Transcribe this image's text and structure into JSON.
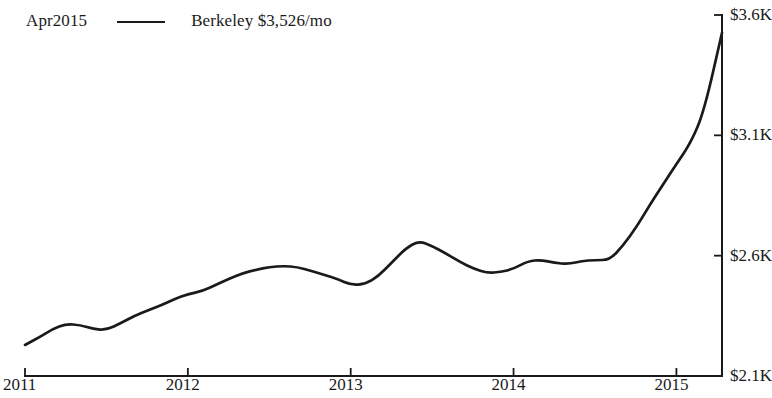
{
  "legend": {
    "date_label": "Apr2015",
    "series_label": "Berkeley $3,526/mo",
    "swatch": "line-swatch"
  },
  "chart_data": {
    "type": "line",
    "title": "",
    "subtitle": "",
    "xlabel": "",
    "ylabel": "",
    "xlim": [
      2011.0,
      2015.28
    ],
    "ylim": [
      2100,
      3600
    ],
    "grid": false,
    "legend_position": "top-left",
    "y_axis_side": "right",
    "xtick_labels": [
      "2011",
      "2012",
      "2013",
      "2014",
      "2015"
    ],
    "xtick_values": [
      2011,
      2012,
      2013,
      2014,
      2015
    ],
    "ytick_labels": [
      "$3.6K",
      "$3.1K",
      "$2.6K",
      "$2.1K"
    ],
    "ytick_values": [
      3600,
      3100,
      2600,
      2100
    ],
    "series": [
      {
        "name": "Berkeley",
        "color": "#1a1a1a",
        "final_value": 3526,
        "final_label": "Apr2015",
        "x": [
          2011.0,
          2011.09,
          2011.17,
          2011.25,
          2011.34,
          2011.42,
          2011.5,
          2011.59,
          2011.67,
          2011.76,
          2011.84,
          2011.92,
          2012.0,
          2012.09,
          2012.17,
          2012.25,
          2012.34,
          2012.42,
          2012.5,
          2012.59,
          2012.67,
          2012.76,
          2012.84,
          2012.92,
          2013.0,
          2013.09,
          2013.17,
          2013.25,
          2013.34,
          2013.42,
          2013.5,
          2013.59,
          2013.67,
          2013.76,
          2013.84,
          2013.92,
          2014.0,
          2014.09,
          2014.17,
          2014.25,
          2014.34,
          2014.42,
          2014.5,
          2014.59,
          2014.67,
          2014.76,
          2014.84,
          2014.92,
          2015.0,
          2015.09,
          2015.17,
          2015.28
        ],
        "y": [
          2229,
          2262,
          2295,
          2316,
          2312,
          2295,
          2291,
          2320,
          2349,
          2374,
          2395,
          2420,
          2440,
          2453,
          2478,
          2503,
          2528,
          2541,
          2553,
          2557,
          2553,
          2536,
          2520,
          2503,
          2478,
          2482,
          2515,
          2570,
          2632,
          2661,
          2640,
          2607,
          2574,
          2545,
          2528,
          2532,
          2545,
          2578,
          2582,
          2570,
          2565,
          2578,
          2582,
          2582,
          2640,
          2724,
          2815,
          2898,
          2981,
          3071,
          3200,
          3526
        ]
      }
    ]
  }
}
